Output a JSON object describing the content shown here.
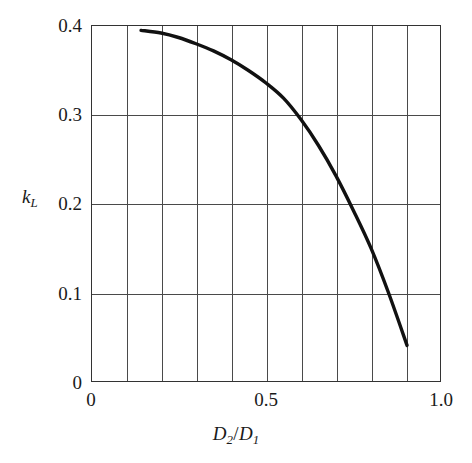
{
  "chart_data": {
    "type": "line",
    "title": "",
    "subtitle": "",
    "xlabel": "D2/D1",
    "ylabel": "kL",
    "xlabel_parts": {
      "base1": "D",
      "sub1": "2",
      "sep": "/",
      "base2": "D",
      "sub2": "1"
    },
    "ylabel_parts": {
      "base": "k",
      "sub": "L"
    },
    "xlim": [
      0,
      1.0
    ],
    "ylim": [
      0,
      0.4
    ],
    "grid": true,
    "grid_x_step": 0.1,
    "grid_y_step": 0.1,
    "legend": "none",
    "x_tick_labels": [
      "0",
      "0.5",
      "1.0"
    ],
    "x_tick_values": [
      0,
      0.5,
      1.0
    ],
    "y_tick_labels": [
      "0",
      "0.1",
      "0.2",
      "0.3",
      "0.4"
    ],
    "y_tick_values": [
      0,
      0.1,
      0.2,
      0.3,
      0.4
    ],
    "series": [
      {
        "name": "kL vs D2/D1",
        "color": "#111111",
        "x": [
          0.143,
          0.2,
          0.25,
          0.3,
          0.35,
          0.4,
          0.45,
          0.5,
          0.55,
          0.6,
          0.65,
          0.7,
          0.75,
          0.8,
          0.85,
          0.903
        ],
        "values": [
          0.394,
          0.391,
          0.386,
          0.379,
          0.371,
          0.361,
          0.349,
          0.335,
          0.318,
          0.294,
          0.265,
          0.231,
          0.192,
          0.15,
          0.1,
          0.041
        ]
      }
    ]
  },
  "figure": {
    "background_color": "#ffffff",
    "axis_color": "#333333",
    "grid_color": "#4a4a4a",
    "curve_color": "#111111"
  }
}
